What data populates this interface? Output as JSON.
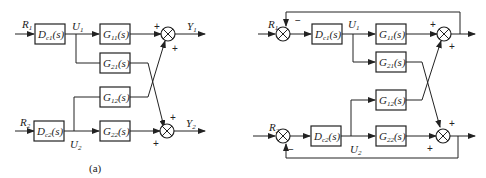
{
  "diagram_a": {
    "caption": "(a)",
    "inputs": [
      {
        "name": "R",
        "sub": "1"
      },
      {
        "name": "R",
        "sub": "2"
      }
    ],
    "controllers": [
      {
        "name": "D",
        "sub": "c1",
        "arg": "(s)"
      },
      {
        "name": "D",
        "sub": "c2",
        "arg": "(s)"
      }
    ],
    "signals": [
      {
        "name": "U",
        "sub": "1"
      },
      {
        "name": "U",
        "sub": "2"
      }
    ],
    "plants": [
      {
        "name": "G",
        "sub": "11",
        "arg": "(s)"
      },
      {
        "name": "G",
        "sub": "21",
        "arg": "(s)"
      },
      {
        "name": "G",
        "sub": "12",
        "arg": "(s)"
      },
      {
        "name": "G",
        "sub": "22",
        "arg": "(s)"
      }
    ],
    "outputs": [
      {
        "name": "Y",
        "sub": "1"
      },
      {
        "name": "Y",
        "sub": "2"
      }
    ],
    "signs": {
      "plus": "+",
      "minus": "−"
    }
  },
  "diagram_b": {
    "inputs": [
      {
        "name": "R",
        "sub": "1"
      },
      {
        "name": "R",
        "sub": "2"
      }
    ],
    "controllers": [
      {
        "name": "D",
        "sub": "c1",
        "arg": "(s)"
      },
      {
        "name": "D",
        "sub": "c2",
        "arg": "(s)"
      }
    ],
    "signals": [
      {
        "name": "U",
        "sub": "1"
      },
      {
        "name": "U",
        "sub": "2"
      }
    ],
    "plants": [
      {
        "name": "G",
        "sub": "11",
        "arg": "(s)"
      },
      {
        "name": "G",
        "sub": "21",
        "arg": "(s)"
      },
      {
        "name": "G",
        "sub": "12",
        "arg": "(s)"
      },
      {
        "name": "G",
        "sub": "22",
        "arg": "(s)"
      }
    ],
    "signs": {
      "plus": "+",
      "minus": "−"
    }
  }
}
